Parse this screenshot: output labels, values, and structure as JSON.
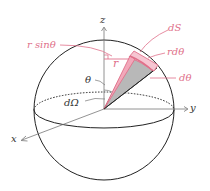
{
  "labels": {
    "z_axis": "z",
    "y_axis": "y",
    "x_axis": "x",
    "dS": "dS",
    "r_dtheta": "rdθ",
    "d_theta": "dθ",
    "r_sin_theta": "r sinθ",
    "r": "r",
    "theta": "θ",
    "d_omega": "dΩ"
  },
  "colors": {
    "accent": "#e0708a",
    "wedge_fill": "#f6c6d2",
    "cone_fill": "#b8b8b8",
    "line": "#222222",
    "axis": "#777777"
  }
}
